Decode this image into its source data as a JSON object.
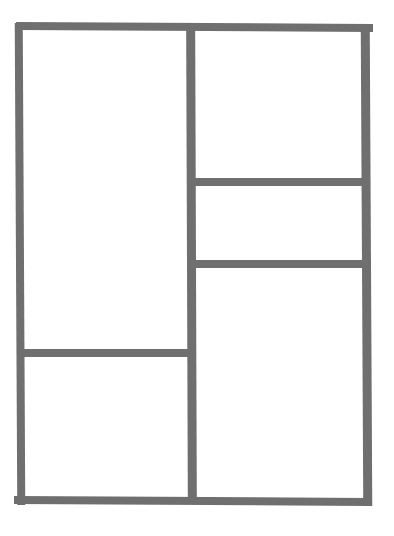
{
  "diagram": {
    "type": "grid-layout",
    "line_color": "#6f6f6f",
    "background": "#ffffff",
    "panels": [
      {
        "id": "left-top",
        "label": ""
      },
      {
        "id": "left-bottom",
        "label": ""
      },
      {
        "id": "right-top",
        "label": ""
      },
      {
        "id": "right-middle",
        "label": ""
      },
      {
        "id": "right-bottom",
        "label": ""
      }
    ]
  }
}
